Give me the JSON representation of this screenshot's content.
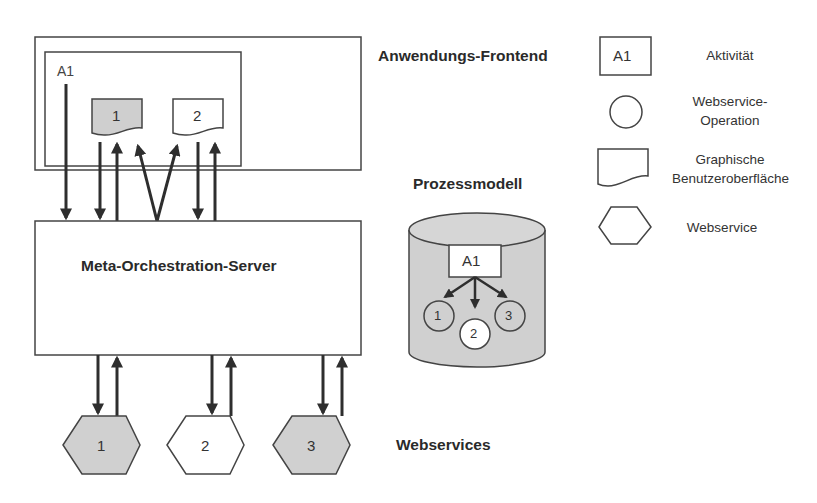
{
  "diagram": {
    "frontend": {
      "title": "Anwendungs-Frontend",
      "activity_label": "A1",
      "guis": [
        {
          "label": "1",
          "fill": "#cfcfcf"
        },
        {
          "label": "2",
          "fill": "#ffffff"
        }
      ]
    },
    "server": {
      "title": "Meta-Orchestration-Server"
    },
    "process_model": {
      "title": "Prozessmodell",
      "activity_label": "A1",
      "operations": [
        {
          "label": "1",
          "fill": "#d0d0d0"
        },
        {
          "label": "2",
          "fill": "#ffffff"
        },
        {
          "label": "3",
          "fill": "#d0d0d0"
        }
      ]
    },
    "webservices": {
      "title": "Webservices",
      "items": [
        {
          "label": "1",
          "fill": "#d0d0d0"
        },
        {
          "label": "2",
          "fill": "#ffffff"
        },
        {
          "label": "3",
          "fill": "#d0d0d0"
        }
      ]
    }
  },
  "legend": {
    "items": [
      {
        "symbol": "A1",
        "label": "Aktivität"
      },
      {
        "symbol": "",
        "label_line1": "Webservice-",
        "label_line2": "Operation"
      },
      {
        "symbol": "",
        "label_line1": "Graphische",
        "label_line2": "Benutzeroberfläche"
      },
      {
        "symbol": "",
        "label": "Webservice"
      }
    ]
  },
  "colors": {
    "stroke": "#333333",
    "gray_fill": "#d0d0d0",
    "white_fill": "#ffffff"
  }
}
